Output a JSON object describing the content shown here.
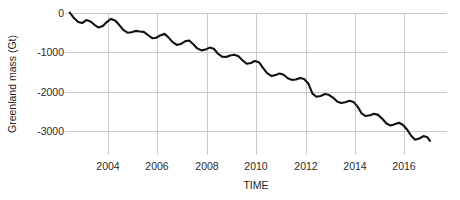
{
  "chart_data": {
    "type": "line",
    "title": "",
    "subtitle": "",
    "xlabel": "TIME",
    "ylabel": "Greenland mass (Gt)",
    "xlim": [
      2002.2,
      2017.3
    ],
    "ylim": [
      -3800,
      250
    ],
    "xticks": [
      2004,
      2006,
      2008,
      2010,
      2012,
      2014,
      2016
    ],
    "xticklabels": [
      "2004",
      "2006",
      "2008",
      "2010",
      "2012",
      "2014",
      "2016"
    ],
    "yticks": [
      0,
      -1000,
      -2000,
      -3000
    ],
    "yticklabels": [
      "0",
      "-1000",
      "-2000",
      "-3000"
    ],
    "grid": true,
    "legend": false,
    "legend_position": "none",
    "line_color": "#111111",
    "grid_color": "#c9c9c9",
    "background_color": "#ffffff",
    "series": [
      {
        "name": "Greenland ice mass anomaly",
        "units": "Gt",
        "x": [
          2002.45,
          2002.62,
          2002.79,
          2002.95,
          2003.12,
          2003.29,
          2003.45,
          2003.62,
          2003.79,
          2003.95,
          2004.12,
          2004.29,
          2004.45,
          2004.62,
          2004.79,
          2004.95,
          2005.12,
          2005.29,
          2005.45,
          2005.62,
          2005.79,
          2005.95,
          2006.12,
          2006.29,
          2006.45,
          2006.62,
          2006.79,
          2006.95,
          2007.12,
          2007.29,
          2007.45,
          2007.62,
          2007.79,
          2007.95,
          2008.12,
          2008.29,
          2008.45,
          2008.62,
          2008.79,
          2008.95,
          2009.12,
          2009.29,
          2009.45,
          2009.62,
          2009.79,
          2009.95,
          2010.12,
          2010.29,
          2010.45,
          2010.62,
          2010.79,
          2010.95,
          2011.12,
          2011.29,
          2011.45,
          2011.62,
          2011.79,
          2011.95,
          2012.12,
          2012.29,
          2012.45,
          2012.62,
          2012.79,
          2012.95,
          2013.12,
          2013.29,
          2013.45,
          2013.62,
          2013.79,
          2013.95,
          2014.12,
          2014.29,
          2014.45,
          2014.62,
          2014.79,
          2014.95,
          2015.12,
          2015.29,
          2015.45,
          2015.62,
          2015.79,
          2015.95,
          2016.12,
          2016.29,
          2016.45,
          2016.62,
          2016.79,
          2016.95,
          2017.05
        ],
        "y": [
          10,
          -130,
          -230,
          -255,
          -180,
          -215,
          -300,
          -370,
          -330,
          -230,
          -150,
          -190,
          -300,
          -430,
          -500,
          -490,
          -455,
          -470,
          -480,
          -560,
          -640,
          -630,
          -570,
          -530,
          -620,
          -740,
          -810,
          -790,
          -720,
          -700,
          -790,
          -900,
          -950,
          -930,
          -880,
          -910,
          -1030,
          -1110,
          -1120,
          -1080,
          -1060,
          -1100,
          -1200,
          -1290,
          -1270,
          -1220,
          -1250,
          -1400,
          -1530,
          -1600,
          -1580,
          -1540,
          -1570,
          -1660,
          -1700,
          -1690,
          -1650,
          -1680,
          -1790,
          -2050,
          -2130,
          -2110,
          -2060,
          -2080,
          -2150,
          -2250,
          -2290,
          -2270,
          -2230,
          -2260,
          -2380,
          -2560,
          -2620,
          -2600,
          -2560,
          -2590,
          -2690,
          -2810,
          -2860,
          -2830,
          -2790,
          -2840,
          -2960,
          -3120,
          -3220,
          -3190,
          -3130,
          -3160,
          -3250
        ]
      }
    ],
    "annotations": []
  },
  "axes": {
    "y_title": "Greenland mass (Gt)",
    "x_title": "TIME"
  }
}
